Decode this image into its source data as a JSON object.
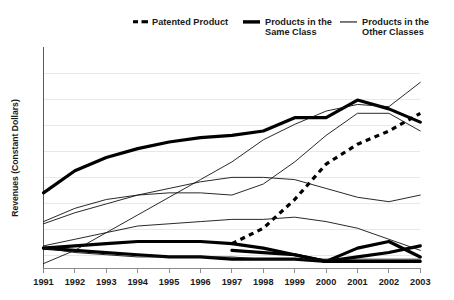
{
  "chart_data": {
    "type": "line",
    "title": "",
    "xlabel": "",
    "ylabel": "Revenues (Constant Dollars)",
    "categories": [
      "1991",
      "1992",
      "1993",
      "1994",
      "1995",
      "1996",
      "1997",
      "1998",
      "1999",
      "2000",
      "2001",
      "2002",
      "2003"
    ],
    "xlim": [
      "1991",
      "2003"
    ],
    "ylim": [
      0,
      100
    ],
    "grid": true,
    "y_tick_labels_shown": false,
    "legend_position": "top",
    "legend": [
      {
        "label": "Patented Product",
        "style": "thick-dashed"
      },
      {
        "label": "Products in the Same Class",
        "style": "thick-solid"
      },
      {
        "label": "Products in the Other Classes",
        "style": "thin-solid"
      }
    ],
    "series": [
      {
        "name": "Patented Product",
        "style": "thick-dashed",
        "x": [
          "1997",
          "1998",
          "1999",
          "2000",
          "2001",
          "2002",
          "2003"
        ],
        "values": [
          11,
          18,
          31,
          47,
          56,
          62,
          70
        ]
      },
      {
        "name": "Products in the Same Class (leading)",
        "style": "thick-solid",
        "x": [
          "1991",
          "1992",
          "1993",
          "1994",
          "1995",
          "1996",
          "1997",
          "1998",
          "1999",
          "2000",
          "2001",
          "2002",
          "2003"
        ],
        "values": [
          34,
          44,
          50,
          54,
          57,
          59,
          60,
          62,
          68,
          68,
          76,
          72,
          66
        ]
      },
      {
        "name": "Products in the Same Class (low A)",
        "style": "thick-solid",
        "x": [
          "1991",
          "1992",
          "1993",
          "1994",
          "1995",
          "1996",
          "1997",
          "1998",
          "1999",
          "2000",
          "2001",
          "2002",
          "2003"
        ],
        "values": [
          9,
          10,
          11,
          12,
          12,
          12,
          11,
          9,
          6,
          3,
          9,
          12,
          5
        ]
      },
      {
        "name": "Products in the Same Class (low B)",
        "style": "thick-solid",
        "x": [
          "1991",
          "1992",
          "1993",
          "1994",
          "1995",
          "1996",
          "1997",
          "1998",
          "1999",
          "2000",
          "2001",
          "2002",
          "2003"
        ],
        "values": [
          9,
          8,
          7,
          6,
          5,
          5,
          4,
          4,
          4,
          3,
          3,
          3,
          3
        ]
      },
      {
        "name": "Products in the Same Class (low C)",
        "style": "thick-solid",
        "x": [
          "1997",
          "1998",
          "1999",
          "2000",
          "2001",
          "2002",
          "2003"
        ],
        "values": [
          8,
          7,
          6,
          3,
          5,
          7,
          10
        ]
      },
      {
        "name": "Products in the Other Classes (steep riser)",
        "style": "thin-solid",
        "x": [
          "1991",
          "1992",
          "1993",
          "1994",
          "1995",
          "1996",
          "1997",
          "1998",
          "1999",
          "2000",
          "2001",
          "2002",
          "2003"
        ],
        "values": [
          2,
          8,
          16,
          24,
          32,
          40,
          48,
          58,
          65,
          71,
          74,
          73,
          84
        ]
      },
      {
        "name": "Products in the Other Classes (upper plateau)",
        "style": "thin-solid",
        "x": [
          "1991",
          "1992",
          "1993",
          "1994",
          "1995",
          "1996",
          "1997",
          "1998",
          "1999",
          "2000",
          "2001",
          "2002",
          "2003"
        ],
        "values": [
          21,
          27,
          31,
          33,
          34,
          34,
          33,
          38,
          48,
          60,
          70,
          70,
          62
        ]
      },
      {
        "name": "Products in the Other Classes (mid decliner)",
        "style": "thin-solid",
        "x": [
          "1991",
          "1992",
          "1993",
          "1994",
          "1995",
          "1996",
          "1997",
          "1998",
          "1999",
          "2000",
          "2001",
          "2002",
          "2003"
        ],
        "values": [
          20,
          25,
          29,
          33,
          36,
          39,
          41,
          41,
          40,
          36,
          32,
          30,
          33
        ]
      },
      {
        "name": "Products in the Other Classes (slow decliner)",
        "style": "thin-solid",
        "x": [
          "1991",
          "1992",
          "1993",
          "1994",
          "1995",
          "1996",
          "1997",
          "1998",
          "1999",
          "2000",
          "2001",
          "2002",
          "2003"
        ],
        "values": [
          10,
          13,
          16,
          19,
          20,
          21,
          22,
          22,
          23,
          21,
          18,
          13,
          8
        ]
      },
      {
        "name": "Products in the Other Classes (bottom riser)",
        "style": "thin-solid",
        "x": [
          "1991",
          "1992",
          "1993",
          "1994",
          "1995",
          "1996",
          "1997",
          "1998",
          "1999",
          "2000",
          "2001",
          "2002",
          "2003"
        ],
        "values": [
          9,
          7,
          6,
          5,
          5,
          5,
          5,
          4,
          4,
          4,
          4,
          4,
          4
        ]
      }
    ]
  }
}
